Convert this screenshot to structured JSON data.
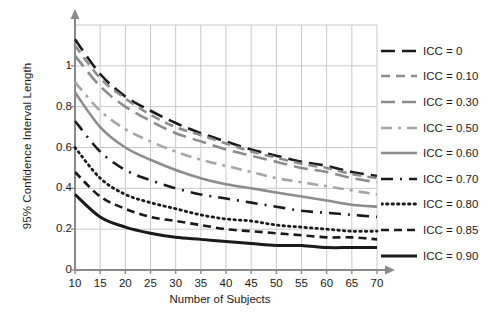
{
  "chart_data": {
    "type": "line",
    "title": "",
    "xlabel": "Number of Subjects",
    "ylabel": "95% Confidence Interval Length",
    "xlim": [
      10,
      70
    ],
    "ylim": [
      0,
      1.2
    ],
    "xticks": [
      10,
      15,
      20,
      25,
      30,
      35,
      40,
      45,
      50,
      55,
      60,
      65,
      70
    ],
    "yticks": [
      0,
      0.2,
      0.4,
      0.6,
      0.8,
      1
    ],
    "ytick_labels": [
      "0",
      "0.2",
      "0.4",
      "0.6",
      "0.8",
      "1"
    ],
    "xtick_labels": [
      "10",
      "15",
      "20",
      "25",
      "30",
      "35",
      "40",
      "45",
      "50",
      "55",
      "60",
      "65",
      "70"
    ],
    "grid": true,
    "legend_position": "right",
    "x": [
      10,
      15,
      20,
      25,
      30,
      35,
      40,
      45,
      50,
      55,
      60,
      65,
      70
    ],
    "series": [
      {
        "name": "ICC = 0",
        "color": "#1a1a1a",
        "dash": "14,7",
        "width": 2.6,
        "values": [
          1.13,
          0.96,
          0.85,
          0.78,
          0.72,
          0.67,
          0.63,
          0.59,
          0.56,
          0.53,
          0.51,
          0.48,
          0.46
        ]
      },
      {
        "name": "ICC = 0.10",
        "color": "#8c8c8c",
        "dash": "9,6",
        "width": 2.6,
        "values": [
          1.1,
          0.94,
          0.84,
          0.76,
          0.7,
          0.66,
          0.62,
          0.58,
          0.55,
          0.52,
          0.5,
          0.47,
          0.45
        ]
      },
      {
        "name": "ICC = 0.30",
        "color": "#8c8c8c",
        "dash": "14,7",
        "width": 2.6,
        "values": [
          1.05,
          0.9,
          0.8,
          0.73,
          0.67,
          0.63,
          0.59,
          0.56,
          0.53,
          0.5,
          0.48,
          0.45,
          0.43
        ]
      },
      {
        "name": "ICC = 0.50",
        "color": "#a6a6a6",
        "dash": "11,6,3,6",
        "width": 2.6,
        "values": [
          0.92,
          0.78,
          0.69,
          0.63,
          0.58,
          0.54,
          0.51,
          0.48,
          0.45,
          0.43,
          0.41,
          0.39,
          0.37
        ]
      },
      {
        "name": "ICC = 0.60",
        "color": "#8c8c8c",
        "dash": "",
        "width": 2.6,
        "values": [
          0.87,
          0.7,
          0.6,
          0.54,
          0.49,
          0.45,
          0.42,
          0.4,
          0.38,
          0.36,
          0.34,
          0.32,
          0.31
        ]
      },
      {
        "name": "ICC = 0.70",
        "color": "#1a1a1a",
        "dash": "12,7,2,7",
        "width": 2.6,
        "values": [
          0.73,
          0.58,
          0.49,
          0.44,
          0.4,
          0.37,
          0.35,
          0.33,
          0.31,
          0.29,
          0.28,
          0.27,
          0.26
        ]
      },
      {
        "name": "ICC = 0.80",
        "color": "#1a1a1a",
        "dash": "1.5,4",
        "width": 2.8,
        "values": [
          0.6,
          0.45,
          0.37,
          0.33,
          0.3,
          0.27,
          0.25,
          0.24,
          0.22,
          0.21,
          0.2,
          0.19,
          0.19
        ]
      },
      {
        "name": "ICC = 0.85",
        "color": "#1a1a1a",
        "dash": "8,5",
        "width": 2.6,
        "values": [
          0.48,
          0.36,
          0.3,
          0.26,
          0.24,
          0.22,
          0.2,
          0.19,
          0.18,
          0.17,
          0.16,
          0.16,
          0.15
        ]
      },
      {
        "name": "ICC = 0.90",
        "color": "#1a1a1a",
        "dash": "",
        "width": 3.0,
        "values": [
          0.37,
          0.26,
          0.21,
          0.18,
          0.16,
          0.15,
          0.14,
          0.13,
          0.12,
          0.12,
          0.11,
          0.11,
          0.11
        ]
      }
    ]
  }
}
